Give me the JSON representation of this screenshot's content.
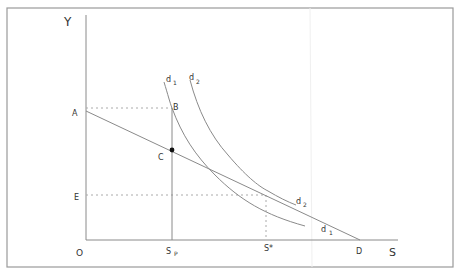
{
  "diagram": {
    "type": "economics-indifference-budget-diagram",
    "axes": {
      "y_label": "Y",
      "x_label": "S",
      "origin_label": "O"
    },
    "points": {
      "A": "A",
      "B": "B",
      "C": "C",
      "D": "D",
      "E": "E"
    },
    "x_ticks": {
      "sp_main": "S",
      "sp_sub": "P",
      "s_star": "S*"
    },
    "curves": [
      {
        "id": "d1",
        "main": "d",
        "sub": "1",
        "position": "top"
      },
      {
        "id": "d2",
        "main": "d",
        "sub": "2",
        "position": "top"
      },
      {
        "id": "d2_end",
        "main": "d",
        "sub": "2",
        "position": "end"
      },
      {
        "id": "d1_end",
        "main": "d",
        "sub": "1",
        "position": "end"
      }
    ],
    "colors": {
      "line": "#8a8a8a",
      "text": "#333333",
      "frame": "#999999",
      "dot": "#111111"
    }
  }
}
